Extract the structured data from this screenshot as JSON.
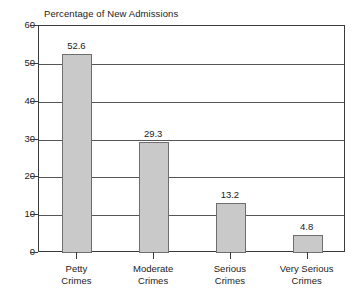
{
  "chart_data": {
    "type": "bar",
    "title": "Percentage of New Admissions",
    "xlabel": "",
    "ylabel": "",
    "categories": [
      "Petty Crimes",
      "Moderate Crimes",
      "Serious Crimes",
      "Very Serious Crimes"
    ],
    "category_lines": [
      [
        "Petty",
        "Crimes"
      ],
      [
        "Moderate",
        "Crimes"
      ],
      [
        "Serious",
        "Crimes"
      ],
      [
        "Very Serious",
        "Crimes"
      ]
    ],
    "values": [
      52.6,
      29.3,
      13.2,
      4.8
    ],
    "value_labels": [
      "52.6",
      "29.3",
      "13.2",
      "4.8"
    ],
    "ylim": [
      0,
      60
    ],
    "yticks": [
      0,
      10,
      20,
      30,
      40,
      50,
      60
    ],
    "ytick_labels": [
      "0",
      "10",
      "20",
      "30",
      "40",
      "50",
      "60"
    ],
    "grid": true,
    "legend": null,
    "colors": {
      "bar_fill": "#c9c9c9",
      "bar_border": "#6e6e6e",
      "axis": "#3a3a3a",
      "gridline": "#555555",
      "text": "#222222",
      "background": "#ffffff"
    }
  }
}
